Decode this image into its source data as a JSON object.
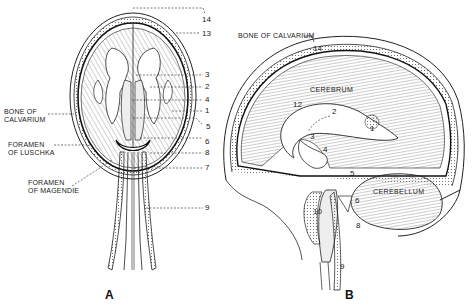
{
  "figure": {
    "panels": [
      {
        "id": "A",
        "letter": "A",
        "view": "coronal-section",
        "side_labels": {
          "bone_of_calvarium": [
            "BONE OF",
            "CALVARIUM"
          ],
          "foramen_of_luschka": [
            "FORAMEN",
            "OF LUSCHKA"
          ],
          "foramen_of_magendie": [
            "FORAMEN",
            "OF MAGENDIE"
          ]
        },
        "callouts": [
          "14",
          "13",
          "3",
          "2",
          "4",
          "1",
          "5",
          "6",
          "8",
          "7",
          "9"
        ]
      },
      {
        "id": "B",
        "letter": "B",
        "view": "sagittal-section",
        "top_label": "BONE OF CALVARIUM",
        "region_labels": {
          "cerebrum": "CEREBRUM",
          "cerebellum": "CEREBELLUM"
        },
        "inline_numbers": [
          "14",
          "12",
          "2",
          "1",
          "3",
          "4",
          "5",
          "6",
          "8",
          "10",
          "9"
        ]
      }
    ],
    "colors": {
      "ink": "#1a1a1a",
      "hatch": "#555555",
      "background": "#ffffff",
      "ventricle_fill": "#ffffff",
      "tissue_fill": "#d9d9d9"
    }
  }
}
